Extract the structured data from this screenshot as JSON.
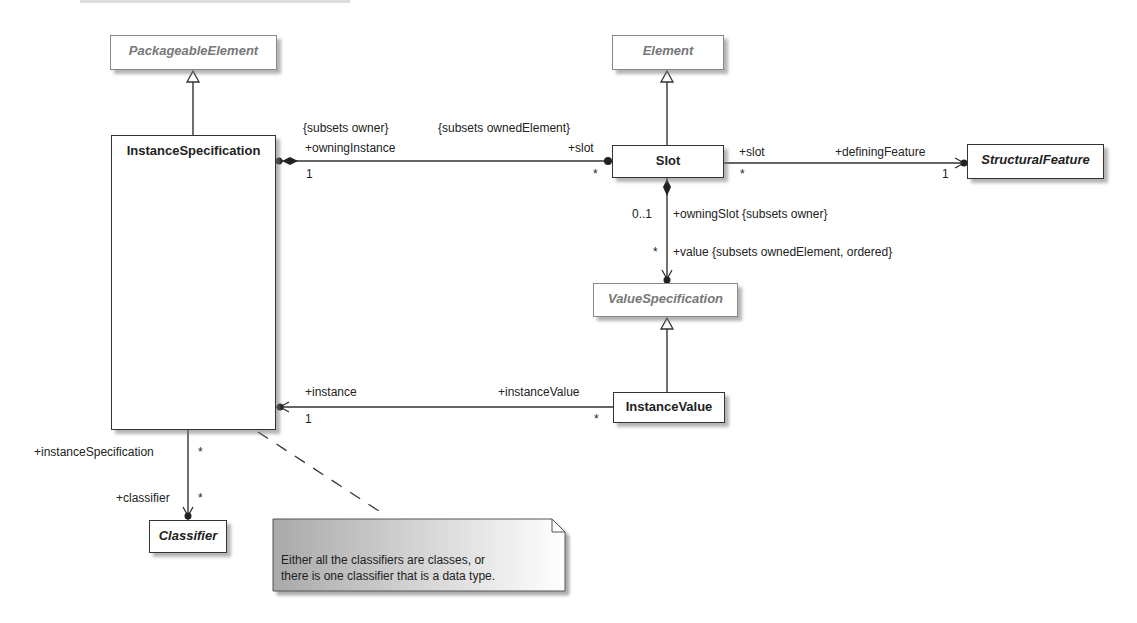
{
  "diagram": {
    "type": "UML class diagram",
    "classes": {
      "packageable_element": {
        "name": "PackageableElement",
        "abstract": true,
        "external": true
      },
      "instance_specification": {
        "name": "InstanceSpecification",
        "abstract": false,
        "external": false
      },
      "element": {
        "name": "Element",
        "abstract": true,
        "external": true
      },
      "slot": {
        "name": "Slot",
        "abstract": false,
        "external": false
      },
      "structural_feature": {
        "name": "StructuralFeature",
        "abstract": true,
        "external": false
      },
      "value_specification": {
        "name": "ValueSpecification",
        "abstract": true,
        "external": true
      },
      "instance_value": {
        "name": "InstanceValue",
        "abstract": false,
        "external": false
      },
      "classifier": {
        "name": "Classifier",
        "abstract": true,
        "external": false
      }
    },
    "generalizations": [
      {
        "child": "InstanceSpecification",
        "parent": "PackageableElement"
      },
      {
        "child": "Slot",
        "parent": "Element"
      },
      {
        "child": "InstanceValue",
        "parent": "ValueSpecification"
      }
    ],
    "associations": {
      "owning_instance_slot": {
        "constraint_left": "{subsets owner}",
        "constraint_right": "{subsets ownedElement}",
        "role_left": "+owningInstance",
        "mult_left": "1",
        "role_right": "+slot",
        "mult_right": "*",
        "kind": "composition"
      },
      "slot_defining_feature": {
        "role_left": "+slot",
        "mult_left": "*",
        "role_right": "+definingFeature",
        "mult_right": "1",
        "kind": "navigable"
      },
      "owning_slot_value": {
        "mult_top": "0..1",
        "role_top": "+owningSlot {subsets owner}",
        "mult_bottom": "*",
        "role_bottom": "+value {subsets ownedElement, ordered}",
        "kind": "composition"
      },
      "instance_instance_value": {
        "role_left": "+instance",
        "mult_left": "1",
        "role_right": "+instanceValue",
        "mult_right": "*",
        "kind": "navigable"
      },
      "instance_spec_classifier": {
        "role_top": "+instanceSpecification",
        "mult_top": "*",
        "role_bottom": "+classifier",
        "mult_bottom": "*",
        "kind": "navigable"
      }
    },
    "note": {
      "line1": "Either all the classifiers are classes, or",
      "line2": "there is one classifier that is a data type."
    },
    "colors": {
      "line": "#333333",
      "external_border": "#888888",
      "external_text": "#777777",
      "note_gradient_start": "#a9a9a9",
      "note_gradient_end": "#ffffff"
    }
  }
}
